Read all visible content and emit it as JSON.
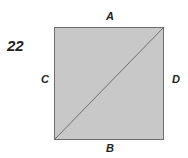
{
  "figure": {
    "number": "22",
    "labels": {
      "top": "A",
      "bottom": "B",
      "left": "C",
      "right": "D"
    },
    "square": {
      "fill": "#c8c8c8",
      "stroke": "#6e6e6e"
    },
    "diagonal": {
      "from": "bottom-left",
      "to": "top-right",
      "stroke": "#6e6e6e"
    }
  }
}
